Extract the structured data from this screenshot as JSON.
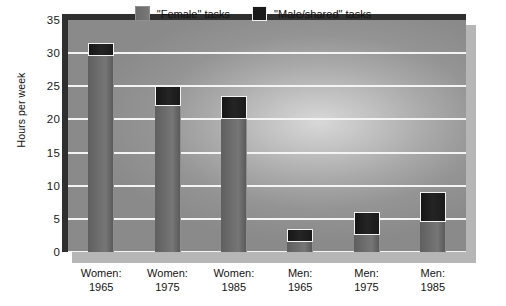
{
  "chart_data": {
    "type": "bar",
    "subtype": "stacked-bar",
    "title": "",
    "xlabel": "",
    "ylabel": "Hours per week",
    "ylim": [
      0,
      35
    ],
    "ytick_values": [
      35,
      30,
      25,
      20,
      15,
      10,
      5,
      0
    ],
    "ytick_labels": [
      "35",
      "30",
      "25",
      "20",
      "15",
      "10",
      "5",
      "0"
    ],
    "grid": true,
    "grid_axis": "y",
    "legend_position": "top-center",
    "categories": [
      "Women:\n1965",
      "Women:\n1975",
      "Women:\n1985",
      "Men:\n1965",
      "Men:\n1975",
      "Men:\n1985"
    ],
    "category_lines": [
      [
        "Women:",
        "1965"
      ],
      [
        "Women:",
        "1975"
      ],
      [
        "Women:",
        "1985"
      ],
      [
        "Men:",
        "1965"
      ],
      [
        "Men:",
        "1975"
      ],
      [
        "Men:",
        "1985"
      ]
    ],
    "series": [
      {
        "name": "\"Female\" tasks",
        "color": "#6e6e6e",
        "values": [
          29.5,
          22.0,
          20.0,
          1.5,
          2.5,
          4.5
        ]
      },
      {
        "name": "\"Male/shared\" tasks",
        "color": "#1a1a1a",
        "values": [
          2.0,
          3.0,
          3.5,
          2.0,
          3.5,
          4.5
        ]
      }
    ],
    "totals": [
      31.5,
      25.0,
      23.5,
      3.5,
      6.0,
      9.0
    ]
  },
  "legend": {
    "entries": [
      {
        "label": "\"Female\" tasks",
        "swatch": "female-swatch"
      },
      {
        "label": "\"Male/shared\" tasks",
        "swatch": "male-swatch"
      }
    ]
  },
  "axes": {
    "y_title": "Hours per week"
  },
  "colors": {
    "plot_background": "#a9a9a9",
    "gridline": "#f4f4f4",
    "frame": "#2f2f2f",
    "shadow": "#b6b6b6",
    "female_bar": "#6e6e6e",
    "male_bar": "#1a1a1a",
    "text": "#141414",
    "page_background": "#ffffff"
  }
}
